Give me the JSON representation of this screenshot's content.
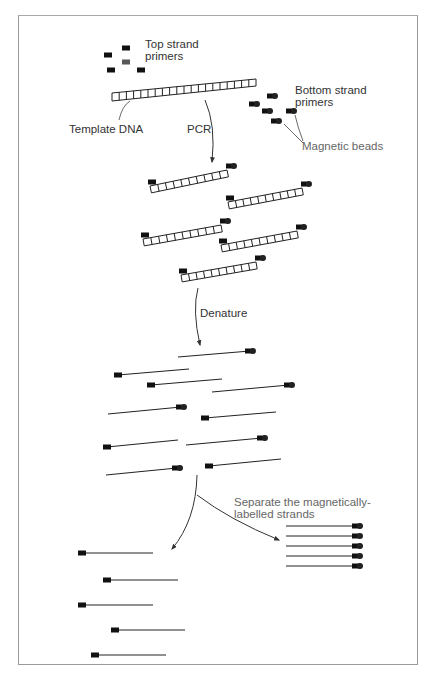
{
  "diagram": {
    "colors": {
      "ink": "#111111",
      "text": "#333333",
      "label_grey": "#666666",
      "frame": "#9a9a9a"
    },
    "labels": {
      "top_primers": [
        "Top strand",
        "primers"
      ],
      "bottom_primers": [
        "Bottom strand",
        "primers"
      ],
      "template": "Template DNA",
      "pcr": "PCR",
      "magnetic_beads": "Magnetic beads",
      "denature": "Denature",
      "separate": [
        "Separate the magnetically-",
        "labelled strands"
      ]
    },
    "stages": [
      {
        "name": "reagents",
        "items": [
          "template-dna-ladder",
          "top-strand-primers x5",
          "bottom-strand-primers-with-beads x5"
        ]
      },
      {
        "name": "pcr-products",
        "count": 5,
        "type": "double-stranded ladder with primer and bead"
      },
      {
        "name": "denatured-strands",
        "count": 10,
        "type": "single strands, half with beads"
      },
      {
        "name": "separated",
        "groups": [
          {
            "name": "unlabelled-strands",
            "count": 5
          },
          {
            "name": "magnetically-labelled-strands",
            "count": 5
          }
        ]
      }
    ]
  }
}
